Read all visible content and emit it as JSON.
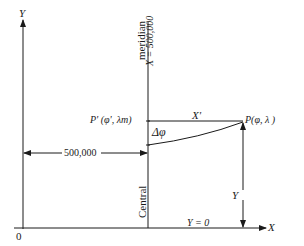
{
  "diagram": {
    "axes": {
      "y_label": "Y",
      "x_label": "X",
      "origin_label": "0"
    },
    "central_meridian": {
      "label_top": "meridian",
      "label_x_value": "X = 500,000",
      "label_bottom": "Central"
    },
    "points": {
      "p_prime": "P' (φ', λm)",
      "p": "P(φ, λ )"
    },
    "segments": {
      "x_prime": "X'",
      "delta_phi": "Δφ",
      "y": "Y",
      "false_easting": "500,000",
      "y_zero": "Y = 0"
    },
    "colors": {
      "line": "#1a1a1a",
      "background": "#ffffff"
    }
  }
}
